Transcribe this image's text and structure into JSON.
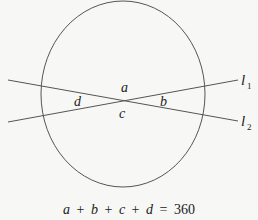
{
  "diagram": {
    "type": "circle with two intersecting chords/lines",
    "colors": {
      "stroke": "#555555",
      "text": "#222222",
      "background": "#f7f7f5"
    },
    "lines": [
      {
        "name": "l1",
        "label": "l",
        "subscript": "1"
      },
      {
        "name": "l2",
        "label": "l",
        "subscript": "2"
      }
    ],
    "angles": {
      "top": "a",
      "right": "b",
      "bottom": "c",
      "left": "d"
    },
    "equation": {
      "lhs_terms": [
        "a",
        "b",
        "c",
        "d"
      ],
      "plus": "+",
      "equals": "=",
      "rhs": "360"
    }
  }
}
